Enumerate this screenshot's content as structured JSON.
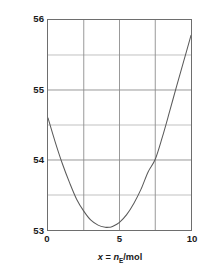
{
  "chart_data": {
    "type": "line",
    "title": "",
    "xlabel": "x = nE/mol",
    "ylabel": "Partial molar volume, VE/(cm3 mol-1)",
    "xlabel_parts": {
      "var": "x",
      "equals": " = ",
      "symbol": "n",
      "subscript": "E",
      "units": "/mol"
    },
    "ylabel_parts": {
      "prefix": "Partial molar volume, ",
      "symbol": "V",
      "subscript": "E",
      "units_open": "/(cm",
      "units_exp1": "3",
      "units_mid": " mol",
      "units_exp2": "−1",
      "units_close": ")"
    },
    "xlim": [
      0,
      10
    ],
    "ylim": [
      53,
      56
    ],
    "grid": true,
    "grid_color": "#8c8c8c",
    "line_color": "#5a5a5a",
    "frame_color": "#6e6e6e",
    "xticks": [
      0,
      5,
      10
    ],
    "xtick_labels": [
      "0",
      "5",
      "10"
    ],
    "x_gridlines": [
      0,
      2.5,
      5,
      7.5,
      10
    ],
    "yticks": [
      53,
      54,
      55,
      56
    ],
    "ytick_labels": [
      "53",
      "54",
      "55",
      "56"
    ],
    "y_gridlines": [
      53,
      53.5,
      54,
      54.5,
      55,
      55.5,
      56
    ],
    "legend": null,
    "x": [
      0,
      0.5,
      1,
      1.5,
      2,
      2.5,
      3,
      3.5,
      4,
      4.3,
      4.5,
      5,
      5.5,
      6,
      6.5,
      7,
      7.5,
      8,
      8.5,
      9,
      9.5,
      10
    ],
    "y": [
      54.6,
      54.26,
      53.95,
      53.68,
      53.44,
      53.27,
      53.14,
      53.07,
      53.04,
      53.04,
      53.05,
      53.11,
      53.22,
      53.38,
      53.58,
      53.83,
      54.01,
      54.33,
      54.69,
      55.06,
      55.42,
      55.78
    ],
    "minimum": {
      "x": 4.3,
      "y": 53.04
    },
    "endpoint_left": {
      "x": 0,
      "y": 54.6
    },
    "endpoint_right": {
      "x": 10,
      "y": 55.78
    }
  }
}
